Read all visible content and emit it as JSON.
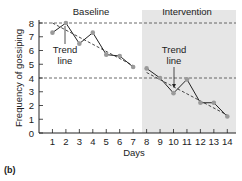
{
  "chart_data": {
    "type": "line",
    "title": "",
    "panel_label": "(b)",
    "xlabel": "Days",
    "ylabel": "Frequency of gossiping",
    "xlim": [
      0,
      14
    ],
    "ylim": [
      0,
      8
    ],
    "xticks": [
      1,
      2,
      3,
      4,
      5,
      6,
      7,
      8,
      9,
      10,
      11,
      12,
      13,
      14
    ],
    "yticks": [
      0,
      1,
      2,
      3,
      4,
      5,
      6,
      7,
      8
    ],
    "phases": [
      {
        "name": "Baseline",
        "days": [
          1,
          7
        ],
        "shaded": false
      },
      {
        "name": "Intervention",
        "days": [
          8,
          14
        ],
        "shaded": true
      }
    ],
    "reference_lines": [
      {
        "y": 8,
        "style": "dashed"
      },
      {
        "y": 4,
        "style": "dashed"
      }
    ],
    "series": [
      {
        "name": "Baseline",
        "x": [
          1,
          2,
          3,
          4,
          5,
          6,
          7
        ],
        "values": [
          7.3,
          8.0,
          6.5,
          7.3,
          5.7,
          5.6,
          4.8
        ]
      },
      {
        "name": "Intervention",
        "x": [
          8,
          9,
          10,
          11,
          12,
          13,
          14
        ],
        "values": [
          4.7,
          4.0,
          2.9,
          3.9,
          2.2,
          2.2,
          1.2
        ]
      }
    ],
    "trend_lines": [
      {
        "phase": "Baseline",
        "start": [
          1,
          8.0
        ],
        "end": [
          7,
          4.9
        ],
        "style": "dashed"
      },
      {
        "phase": "Intervention",
        "start": [
          8,
          4.4
        ],
        "end": [
          14,
          1.3
        ],
        "style": "dashed"
      }
    ],
    "annotations": [
      {
        "text": "Trend line",
        "phase": "Baseline"
      },
      {
        "text": "Trend line",
        "phase": "Intervention"
      }
    ]
  },
  "labels": {
    "baseline": "Baseline",
    "intervention": "Intervention",
    "trend1_a": "Trend",
    "trend1_b": "line",
    "trend2_a": "Trend",
    "trend2_b": "line",
    "xlabel": "Days",
    "ylabel": "Frequency of gossiping",
    "panel": "(b)"
  },
  "colors": {
    "shade": "#e6e6e6",
    "line": "#222222",
    "marker": "#9a9a9a",
    "text": "#222222"
  }
}
